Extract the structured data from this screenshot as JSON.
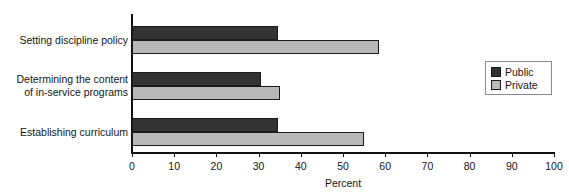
{
  "chart_data": {
    "type": "bar",
    "orientation": "horizontal",
    "title": "",
    "xlabel": "Percent",
    "ylabel": "",
    "xlim": [
      0,
      100
    ],
    "grid": false,
    "legend_position": "top-right",
    "categories": [
      "Setting discipline policy",
      "Determining the content of in-service programs",
      "Establishing curriculum"
    ],
    "category_lines": [
      [
        "Setting discipline policy"
      ],
      [
        "Determining the content",
        "of in-service programs"
      ],
      [
        "Establishing curriculum"
      ]
    ],
    "series": [
      {
        "name": "Public",
        "color": "#333333",
        "values": [
          34.5,
          30.5,
          34.5
        ]
      },
      {
        "name": "Private",
        "color": "#b8b8b8",
        "values": [
          58.5,
          35.0,
          55.0
        ]
      }
    ],
    "xticks": [
      0,
      10,
      20,
      30,
      40,
      50,
      60,
      70,
      80,
      90,
      100
    ],
    "xtick_labels": [
      "0",
      "10",
      "20",
      "30",
      "40",
      "50",
      "60",
      "70",
      "80",
      "90",
      "100"
    ]
  },
  "legend": {
    "entries": [
      {
        "label": "Public"
      },
      {
        "label": "Private"
      }
    ]
  }
}
